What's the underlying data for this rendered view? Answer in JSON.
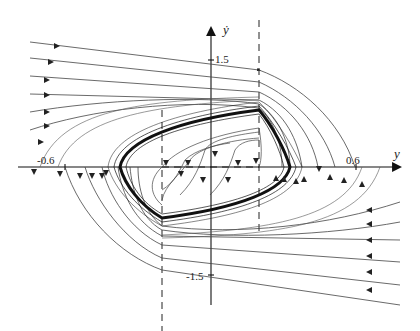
{
  "figure": {
    "type": "phase-portrait",
    "axes": {
      "x_label": "y",
      "y_label": "ẏ",
      "x_ticks": [
        "-0.6",
        "0.6"
      ],
      "y_ticks": [
        "1.5",
        "-1.5"
      ]
    },
    "switching_lines": [
      "dashed vertical left",
      "dashed vertical right",
      "dashed horizontal segment"
    ],
    "limit_cycle": "thick closed hexagonal orbit",
    "colors": {
      "curve": "#333333",
      "axis": "#222222",
      "background": "#ffffff"
    }
  }
}
